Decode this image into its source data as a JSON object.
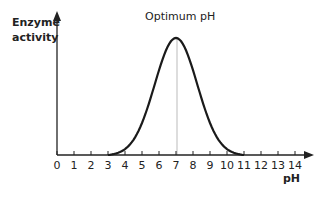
{
  "chart_data": {
    "type": "line",
    "title": "",
    "xlabel": "pH",
    "ylabel": "Enzyme activity",
    "ylabel_lines": [
      "Enzyme",
      "activity"
    ],
    "x_ticks": [
      0,
      1,
      2,
      3,
      4,
      5,
      6,
      7,
      8,
      9,
      10,
      11,
      12,
      13,
      14
    ],
    "xlim": [
      0,
      14
    ],
    "y_ticks": [],
    "grid": false,
    "legend": null,
    "annotations": [
      {
        "text": "Optimum pH",
        "x": 7,
        "reference_line": "vertical at x=7"
      }
    ],
    "series": [
      {
        "name": "Enzyme activity",
        "shape": "bell curve",
        "x": [
          3,
          4,
          5,
          6,
          6.5,
          7,
          7.5,
          8,
          9,
          10,
          11
        ],
        "values": [
          0,
          0.08,
          0.3,
          0.75,
          0.93,
          1.0,
          0.93,
          0.75,
          0.3,
          0.08,
          0
        ],
        "peak_x": 7,
        "range": [
          3,
          11
        ]
      }
    ]
  },
  "labels": {
    "ylabel_line1": "Enzyme",
    "ylabel_line2": "activity",
    "xlabel": "pH",
    "annotation": "Optimum pH"
  },
  "ticks": [
    "0",
    "1",
    "2",
    "3",
    "4",
    "5",
    "6",
    "7",
    "8",
    "9",
    "10",
    "11",
    "12",
    "13",
    "14"
  ]
}
